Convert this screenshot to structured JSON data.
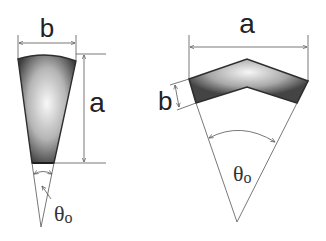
{
  "diagram": {
    "colors": {
      "outline": "#333333",
      "dimension_line": "#555555",
      "fill_dark": "#3a3a3a",
      "fill_light": "#f4f4f4",
      "background": "#ffffff"
    },
    "left_figure": {
      "name": "tapered wedge segment",
      "width_label": "b",
      "height_label": "a",
      "angle_label": "θ",
      "angle_subscript": "o"
    },
    "right_figure": {
      "name": "chevron arc segment",
      "width_label": "a",
      "thickness_label": "b",
      "angle_label": "θ",
      "angle_subscript": "o"
    }
  }
}
